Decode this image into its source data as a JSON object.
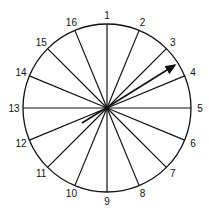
{
  "diagram": {
    "type": "radial-sector-diagram",
    "center": [
      107,
      108
    ],
    "radius": 84,
    "spokes": [
      {
        "label": "1",
        "angle": 0
      },
      {
        "label": "2",
        "angle": 22.5
      },
      {
        "label": "3",
        "angle": 45
      },
      {
        "label": "4",
        "angle": 67.5
      },
      {
        "label": "5",
        "angle": 90
      },
      {
        "label": "6",
        "angle": 112.5
      },
      {
        "label": "7",
        "angle": 135
      },
      {
        "label": "8",
        "angle": 157.5
      },
      {
        "label": "9",
        "angle": 180
      },
      {
        "label": "10",
        "angle": 202.5
      },
      {
        "label": "11",
        "angle": 225
      },
      {
        "label": "12",
        "angle": 247.5
      },
      {
        "label": "13",
        "angle": 270
      },
      {
        "label": "14",
        "angle": 292.5
      },
      {
        "label": "15",
        "angle": 315
      },
      {
        "label": "16",
        "angle": 337.5
      }
    ],
    "arrow": {
      "from": [
        82,
        123
      ],
      "to": [
        175,
        65
      ],
      "description": "arrow pointing between spokes 3 and 4"
    },
    "colors": {
      "stroke": "#111111",
      "background": "#ffffff"
    }
  }
}
